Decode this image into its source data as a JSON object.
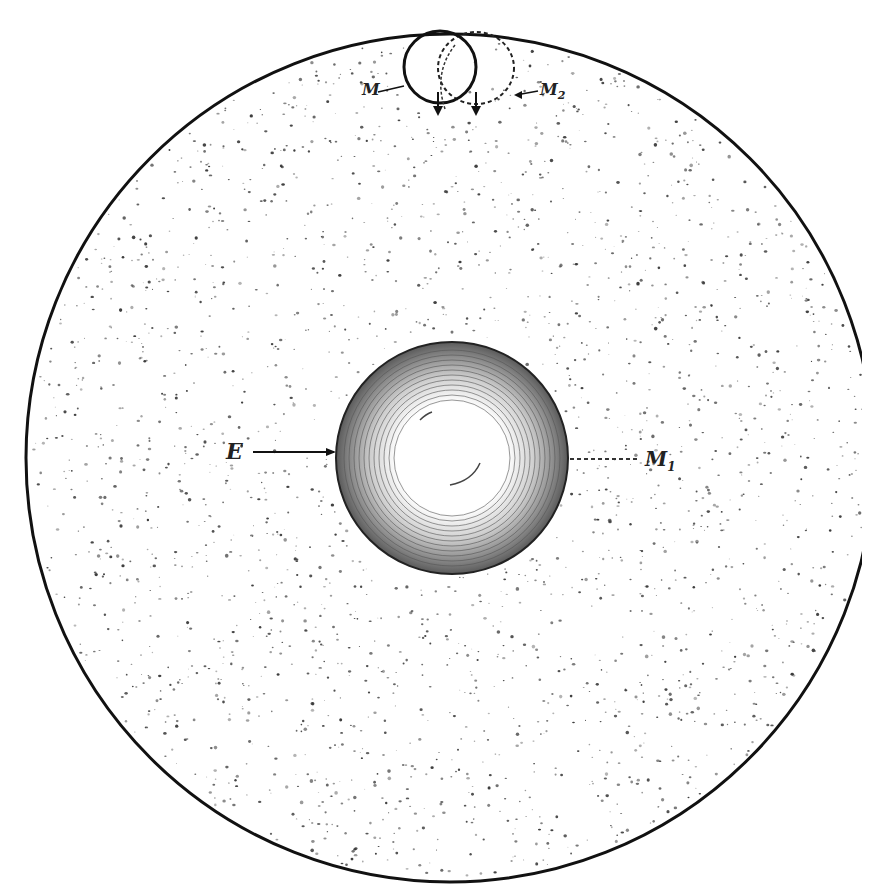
{
  "figure": {
    "title": "",
    "colors": {
      "ink": "#111111",
      "background": "#ffffff",
      "speckle": "#555555"
    }
  },
  "labels": {
    "earth": "E",
    "moon": "M",
    "moon_1": "M",
    "moon_1_sub": "1",
    "moon_2": "M",
    "moon_2_sub": "2"
  },
  "geometry": {
    "outer_circle": {
      "cx": 450,
      "cy": 458,
      "r": 424
    },
    "earth": {
      "cx": 452,
      "cy": 458,
      "r": 116
    },
    "moon_solid": {
      "cx": 440,
      "cy": 67,
      "r": 36
    },
    "moon_dashed": {
      "cx": 476,
      "cy": 68,
      "rx": 38,
      "ry": 36
    }
  }
}
